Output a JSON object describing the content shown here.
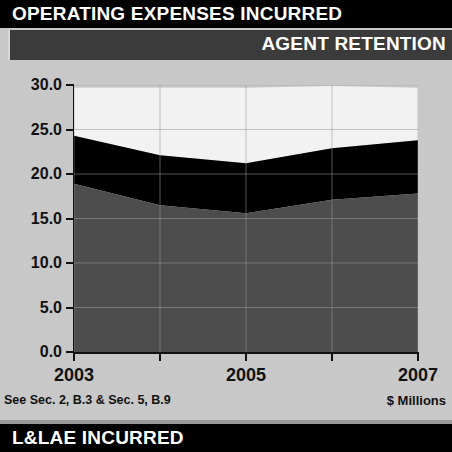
{
  "header": {
    "title": "OPERATING EXPENSES INCURRED",
    "subtitle": "AGENT RETENTION"
  },
  "footer": {
    "banner": "L&LAE INCURRED"
  },
  "notes": {
    "source": "See Sec. 2, B.3 & Sec. 5, B.9",
    "units": "$ Millions"
  },
  "colors": {
    "title_bar": "#000000",
    "subtitle_bar": "#3b3b3b",
    "panel_background": "#c8c8c8",
    "series_bottom": "#4d4d4d",
    "series_middle": "#000000",
    "series_top": "#f2f2f2",
    "axis": "#111111",
    "gridline": "#9a9a9a"
  },
  "chart_data": {
    "type": "area",
    "title": "AGENT RETENTION",
    "xlabel": "",
    "ylabel": "$ Millions",
    "ylim": [
      0.0,
      30.0
    ],
    "ytick_step": 5.0,
    "ytick_labels": [
      "30.0",
      "25.0",
      "20.0",
      "15.0",
      "10.0",
      "5.0",
      "0.0"
    ],
    "ytick_values": [
      30.0,
      25.0,
      20.0,
      15.0,
      10.0,
      5.0,
      0.0
    ],
    "x": [
      2003,
      2004,
      2005,
      2006,
      2007
    ],
    "xtick_labels": [
      "2003",
      "",
      "2005",
      "",
      "2007"
    ],
    "xtick_shown": [
      "2003",
      "2005",
      "2007"
    ],
    "grid": true,
    "legend_position": "none",
    "stacked": true,
    "series": [
      {
        "name": "series-bottom",
        "color": "#4d4d4d",
        "values": [
          18.9,
          16.5,
          15.6,
          17.1,
          17.8
        ]
      },
      {
        "name": "series-middle",
        "color": "#000000",
        "values": [
          5.4,
          5.6,
          5.6,
          5.8,
          6.0
        ]
      },
      {
        "name": "series-top",
        "color": "#f2f2f2",
        "values": [
          5.4,
          7.6,
          8.5,
          7.0,
          5.9
        ]
      }
    ],
    "cumulative": [
      {
        "name": "bottom-top-edge",
        "values": [
          18.9,
          16.5,
          15.6,
          17.1,
          17.8
        ]
      },
      {
        "name": "middle-top-edge",
        "values": [
          24.3,
          22.1,
          21.2,
          22.9,
          23.8
        ]
      },
      {
        "name": "top-top-edge",
        "values": [
          29.7,
          29.7,
          29.7,
          29.9,
          29.7
        ]
      }
    ]
  }
}
